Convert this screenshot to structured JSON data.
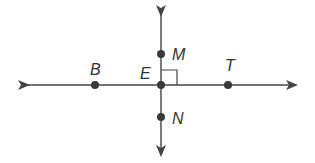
{
  "diagram": {
    "type": "perpendicular-lines",
    "colors": {
      "line": "#444444",
      "point": "#3a3a3a",
      "label": "#333333",
      "background": "#ffffff"
    },
    "lines": {
      "horizontal": {
        "from": [
          28,
          85
        ],
        "to": [
          296,
          85
        ],
        "arrows": "both"
      },
      "vertical": {
        "from": [
          161,
          15
        ],
        "to": [
          161,
          155
        ],
        "arrows": "both"
      }
    },
    "right_angle_marker": {
      "vertex": "E",
      "size": 16
    },
    "points": [
      {
        "id": "B",
        "label": "B",
        "x": 95,
        "y": 85,
        "label_x": 90,
        "label_y": 75
      },
      {
        "id": "E",
        "label": "E",
        "x": 161,
        "y": 85,
        "label_x": 140,
        "label_y": 79
      },
      {
        "id": "T",
        "label": "T",
        "x": 228,
        "y": 85,
        "label_x": 225,
        "label_y": 71
      },
      {
        "id": "M",
        "label": "M",
        "x": 161,
        "y": 54,
        "label_x": 172,
        "label_y": 60
      },
      {
        "id": "N",
        "label": "N",
        "x": 161,
        "y": 117,
        "label_x": 172,
        "label_y": 124
      }
    ]
  }
}
